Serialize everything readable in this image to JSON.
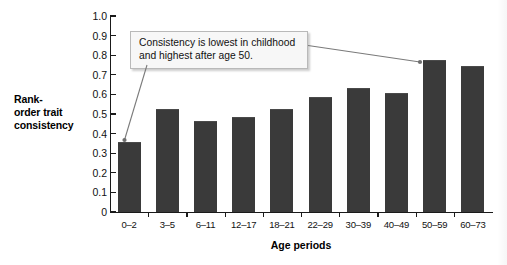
{
  "chart_data": {
    "type": "bar",
    "title": "",
    "xlabel": "Age periods",
    "ylabel": "Rank-order trait consistency",
    "categories": [
      "0–2",
      "3–5",
      "6–11",
      "12–17",
      "18–21",
      "22–29",
      "30–39",
      "40–49",
      "50–59",
      "60–73"
    ],
    "values": [
      0.35,
      0.52,
      0.46,
      0.48,
      0.52,
      0.58,
      0.63,
      0.6,
      0.77,
      0.74
    ],
    "ylim": [
      0,
      1.0
    ],
    "ytick_labels": [
      "1.0",
      "0.9",
      "0.8",
      "0.7",
      "0.6",
      "0.5",
      "0.4",
      "0.3",
      "0.2",
      "0.1",
      "0"
    ],
    "ytick_values": [
      1.0,
      0.9,
      0.8,
      0.7,
      0.6,
      0.5,
      0.4,
      0.3,
      0.2,
      0.1,
      0
    ],
    "grid": false,
    "legend": null,
    "bar_color": "#3a3a3a",
    "annotations": [
      {
        "text": "Consistency is lowest in childhood and highest after age 50.",
        "line1": "Consistency is lowest in childhood",
        "line2": "and highest after age 50.",
        "points_to": [
          "0–2",
          "50–59"
        ]
      }
    ]
  },
  "axis": {
    "y_title_line1": "Rank-",
    "y_title_line2": "order trait",
    "y_title_line3": "consistency",
    "x_title": "Age periods"
  }
}
